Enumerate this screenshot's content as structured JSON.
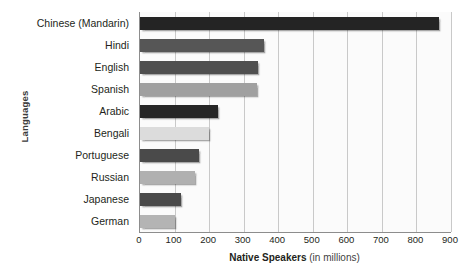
{
  "chart_data": {
    "type": "bar",
    "orientation": "horizontal",
    "title": "",
    "xlabel": "Native Speakers (in millions)",
    "xlabel_bold_part": "Native Speakers",
    "xlabel_regular_part": " (in millions)",
    "ylabel": "Languages",
    "categories": [
      "Chinese (Mandarin)",
      "Hindi",
      "English",
      "Spanish",
      "Arabic",
      "Bengali",
      "Portuguese",
      "Russian",
      "Japanese",
      "German"
    ],
    "values": [
      865,
      358,
      341,
      340,
      225,
      200,
      170,
      158,
      120,
      100
    ],
    "bar_colors": [
      "#242424",
      "#565656",
      "#4f4f4f",
      "#a0a0a0",
      "#262626",
      "#dcdcdc",
      "#4a4a4a",
      "#b0b0b0",
      "#4a4a4a",
      "#b4b4b4"
    ],
    "xlim": [
      0,
      900
    ],
    "xticks": [
      0,
      100,
      200,
      300,
      400,
      500,
      600,
      700,
      800,
      900
    ],
    "xtick_labels": [
      "0",
      "100",
      "200",
      "300",
      "400",
      "500",
      "600",
      "700",
      "800",
      "900"
    ],
    "grid": true,
    "grid_axis": "x",
    "legend": "none",
    "plot_background": "#fbfbfb",
    "gridline_color": "#c9c9c9",
    "axis_color": "#8d8d8d",
    "text_color": "#231f20"
  }
}
